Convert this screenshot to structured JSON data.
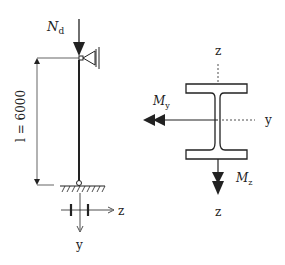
{
  "column_diagram": {
    "load_label": "N",
    "load_subscript": "d",
    "length_label": "l = 6000",
    "section_axis_z": "z",
    "section_axis_y": "y"
  },
  "cross_section": {
    "axis_z_top": "z",
    "axis_y": "y",
    "axis_z_bottom": "z",
    "moment_y_label": "M",
    "moment_y_subscript": "y",
    "moment_z_label": "M",
    "moment_z_subscript": "z"
  },
  "colors": {
    "line": "#222222",
    "background": "#ffffff"
  }
}
